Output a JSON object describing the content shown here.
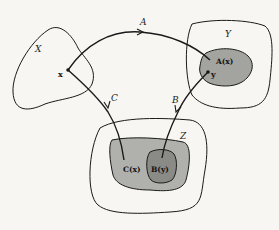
{
  "diagram": {
    "title": "",
    "sets": [
      {
        "id": "X",
        "label": "X"
      },
      {
        "id": "Y",
        "label": "Y"
      },
      {
        "id": "Z",
        "label": "Z"
      }
    ],
    "points": [
      {
        "id": "x",
        "label": "x",
        "in": "X"
      },
      {
        "id": "y",
        "label": "y",
        "in": "A(x)"
      }
    ],
    "subsets": [
      {
        "id": "Ax",
        "label": "A(x)",
        "in": "Y",
        "fill": "#a3a3a0"
      },
      {
        "id": "Cx",
        "label": "C(x)",
        "in": "Z",
        "fill": "#b0b0ad"
      },
      {
        "id": "By",
        "label": "B(y)",
        "in": "C(x)",
        "fill": "#8a8a87"
      }
    ],
    "arrows": [
      {
        "id": "A",
        "label": "A",
        "from": "x",
        "to": "A(x)"
      },
      {
        "id": "B",
        "label": "B",
        "from": "y",
        "to": "B(y)"
      },
      {
        "id": "C",
        "label": "C",
        "from": "x",
        "to": "C(x)"
      }
    ],
    "colors": {
      "background": "#f7f6f2",
      "stroke": "#1a1a1a"
    }
  }
}
